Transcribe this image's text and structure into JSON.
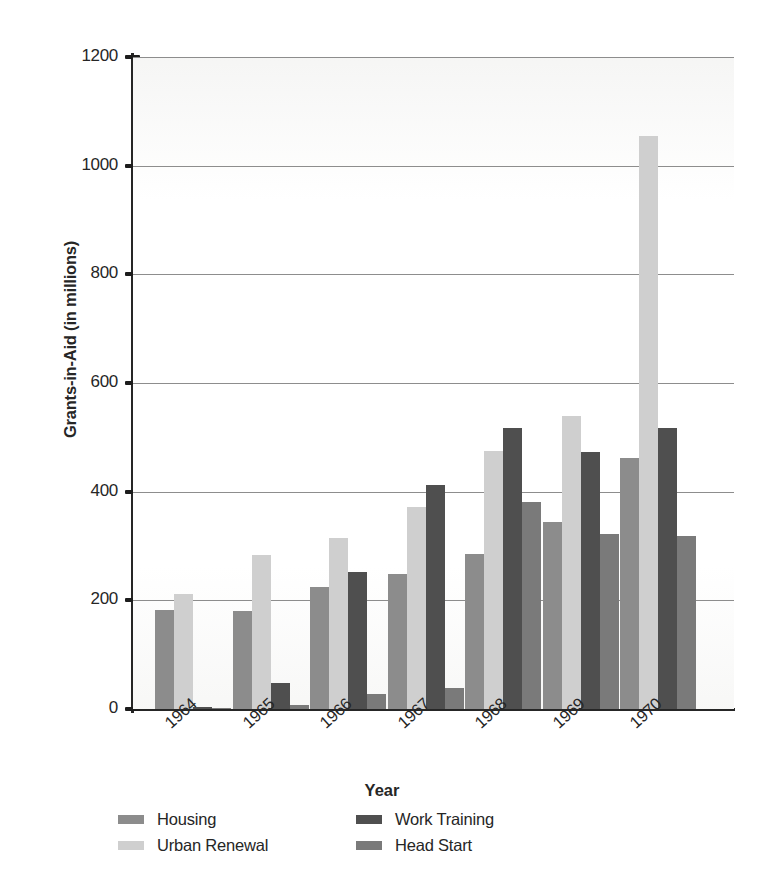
{
  "chart_data": {
    "type": "bar",
    "title": "",
    "xlabel": "Year",
    "ylabel": "Grants-in-Aid (in millions)",
    "categories": [
      "1964",
      "1965",
      "1966",
      "1967",
      "1968",
      "1969",
      "1970"
    ],
    "ylim": [
      0,
      1200
    ],
    "yticks": [
      0,
      200,
      400,
      600,
      800,
      1000,
      1200
    ],
    "ytick_labels": [
      "0",
      "200",
      "400",
      "600",
      "800",
      "1000",
      "1200"
    ],
    "grid": true,
    "legend_position": "bottom",
    "series": [
      {
        "name": "Housing",
        "color": "#8c8c8c",
        "values": [
          182,
          180,
          225,
          248,
          285,
          345,
          462
        ]
      },
      {
        "name": "Urban Renewal",
        "color": "#cfcfcf",
        "values": [
          212,
          283,
          315,
          372,
          475,
          540,
          1055
        ]
      },
      {
        "name": "Work Training",
        "color": "#4f4f4f",
        "values": [
          3,
          48,
          252,
          412,
          518,
          473,
          518
        ]
      },
      {
        "name": "Head Start",
        "color": "#7a7a7a",
        "values": [
          2,
          8,
          28,
          38,
          381,
          322,
          318
        ]
      }
    ]
  }
}
